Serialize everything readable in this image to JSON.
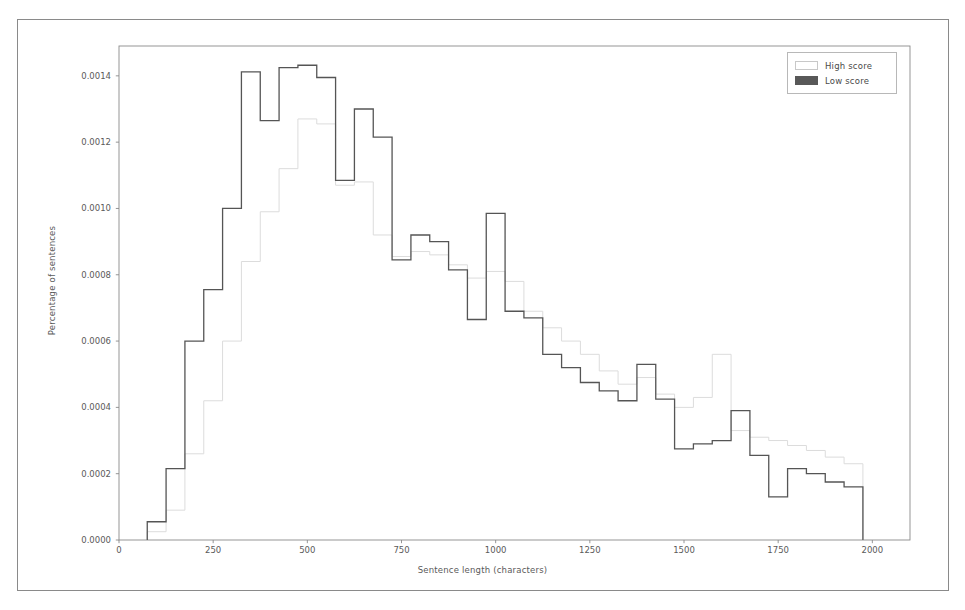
{
  "chart_data": {
    "type": "line",
    "subtype": "step-histogram",
    "title": "",
    "xlabel": "Sentence length (characters)",
    "ylabel": "Percentage of sentences",
    "xlim": [
      0,
      2100
    ],
    "ylim": [
      0,
      0.00149
    ],
    "grid": false,
    "legend_position": "upper right",
    "xticks": [
      0,
      250,
      500,
      750,
      1000,
      1250,
      1500,
      1750,
      2000
    ],
    "xtick_labels": [
      "0",
      "250",
      "500",
      "750",
      "1000",
      "1250",
      "1500",
      "1750",
      "2000"
    ],
    "yticks": [
      0.0,
      0.0002,
      0.0004,
      0.0006,
      0.0008,
      0.001,
      0.0012,
      0.0014
    ],
    "ytick_labels": [
      "0.0000",
      "0.0002",
      "0.0004",
      "0.0006",
      "0.0008",
      "0.0010",
      "0.0012",
      "0.0014"
    ],
    "bin_width": 50,
    "bin_edges": [
      75,
      125,
      175,
      225,
      275,
      325,
      375,
      425,
      475,
      525,
      575,
      625,
      675,
      725,
      775,
      825,
      875,
      925,
      975,
      1025,
      1075,
      1125,
      1175,
      1225,
      1275,
      1325,
      1375,
      1425,
      1475,
      1525,
      1575,
      1625,
      1675,
      1725,
      1775,
      1825,
      1875,
      1925,
      1975
    ],
    "series": [
      {
        "name": "Low score",
        "color": "#555555",
        "linewidth": 1.3,
        "values": [
          5.5e-05,
          0.000215,
          0.0006,
          0.000755,
          0.001,
          0.001412,
          0.001265,
          0.001425,
          0.001432,
          0.001395,
          0.001085,
          0.0013,
          0.001215,
          0.000845,
          0.00092,
          0.0009,
          0.000815,
          0.000665,
          0.000985,
          0.00069,
          0.00067,
          0.00056,
          0.00052,
          0.000475,
          0.00045,
          0.00042,
          0.00053,
          0.000425,
          0.000275,
          0.00029,
          0.0003,
          0.00039,
          0.000255,
          0.00013,
          0.000215,
          0.0002,
          0.000175,
          0.00016
        ]
      },
      {
        "name": "High score",
        "color": "#dcdcdc",
        "linewidth": 1.0,
        "values": [
          2.5e-05,
          9e-05,
          0.00026,
          0.00042,
          0.0006,
          0.00084,
          0.00099,
          0.00112,
          0.00127,
          0.001255,
          0.00107,
          0.00108,
          0.00092,
          0.000855,
          0.00087,
          0.00086,
          0.00083,
          0.00079,
          0.00081,
          0.00078,
          0.00069,
          0.00064,
          0.0006,
          0.00056,
          0.00051,
          0.00047,
          0.00049,
          0.00044,
          0.0004,
          0.00043,
          0.00056,
          0.00033,
          0.00031,
          0.0003,
          0.000285,
          0.00027,
          0.00025,
          0.00023
        ]
      }
    ],
    "legend": [
      {
        "label": "High score",
        "swatch_fill": "#ffffff",
        "swatch_stroke": "#c8c8c8"
      },
      {
        "label": "Low score",
        "swatch_fill": "#585858",
        "swatch_stroke": "#585858"
      }
    ]
  },
  "style": {
    "axes_color": "#8a8a8a",
    "tick_text_color": "#5a5a5a",
    "figure_border_color": "#8a8a8a",
    "background": "#ffffff"
  }
}
